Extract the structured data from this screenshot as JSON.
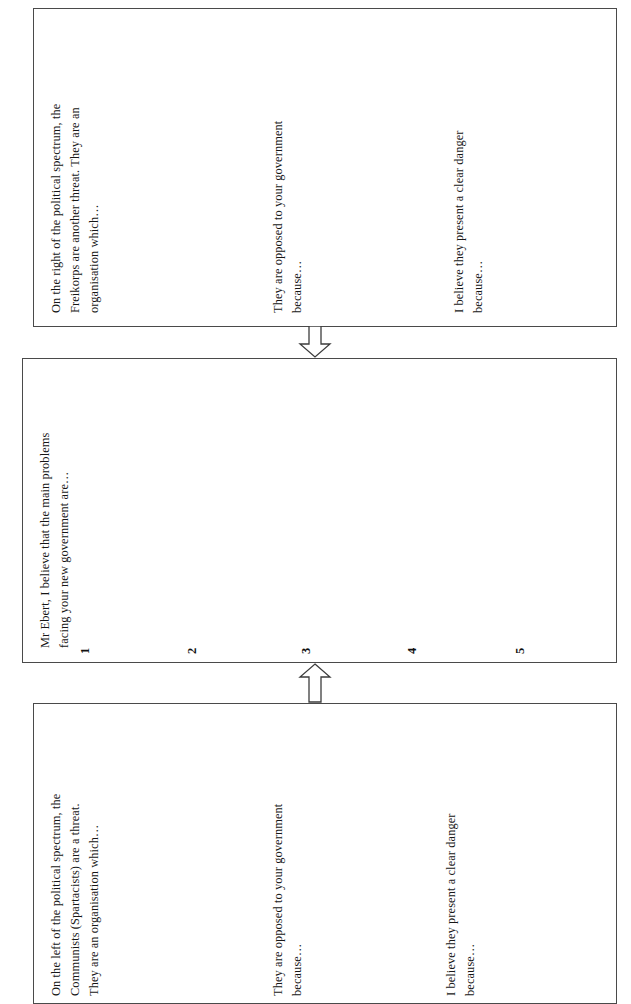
{
  "document": {
    "title": "Mr Ebert problems worksheet",
    "orientation": "rotated-90-ccw",
    "page_background": "#ffffff",
    "border_color": "#4a4a4a",
    "text_color": "#161616"
  },
  "boxes": {
    "right_wing": {
      "name": "Freikorps threat box",
      "paragraph_1": {
        "line_1": "On the right of the political spectrum, the",
        "line_2": "Freikorps are another threat. They are an",
        "line_3": "organisation which…"
      },
      "paragraph_2": {
        "line_1": "They are opposed to your government",
        "line_2": "because…"
      },
      "paragraph_3": {
        "line_1": "I believe they present a clear danger",
        "line_2": "because…"
      }
    },
    "centre": {
      "name": "Main problems box",
      "heading": {
        "line_1": "Mr Ebert, I believe that the main problems",
        "line_2": "facing your new government are…"
      },
      "numbers": [
        "1",
        "2",
        "3",
        "4",
        "5"
      ]
    },
    "left_wing": {
      "name": "Spartacists threat box",
      "paragraph_1": {
        "line_1": "On the left of the political spectrum, the",
        "line_2": "Communists (Spartacists) are a threat.",
        "line_3": "They are an organisation which…"
      },
      "paragraph_2": {
        "line_1": "They are opposed to your government",
        "line_2": "because…"
      },
      "paragraph_3": {
        "line_1": "I believe they present a clear danger",
        "line_2": "because…"
      }
    }
  },
  "arrows": {
    "from_right_box": {
      "direction": "points-toward-centre-box"
    },
    "from_left_box": {
      "direction": "points-toward-centre-box"
    }
  }
}
